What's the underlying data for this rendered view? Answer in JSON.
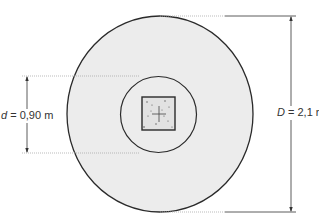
{
  "diagram": {
    "title_fragment": "",
    "labels": {
      "d_symbol": "d",
      "d_value": " = 0,90 m",
      "D_symbol": "D",
      "D_value": " = 2,1 m"
    },
    "shapes": {
      "outer_circle": {
        "cx": 160,
        "cy": 114,
        "rx": 93,
        "ry": 98,
        "fill": "#ececec",
        "stroke": "#2a2a2a"
      },
      "inner_circle": {
        "cx": 158.5,
        "cy": 114.5,
        "r": 38,
        "fill": "#ececec",
        "stroke": "#2a2a2a"
      },
      "square_pile": {
        "x": 142,
        "y": 97,
        "w": 33,
        "h": 33,
        "fill": "#e4e4e4",
        "stroke": "#2a2a2a"
      }
    },
    "dimensions": {
      "d": {
        "x": 27,
        "y1": 76,
        "y2": 153
      },
      "D": {
        "x": 291,
        "y1": 16,
        "y2": 212
      }
    }
  }
}
